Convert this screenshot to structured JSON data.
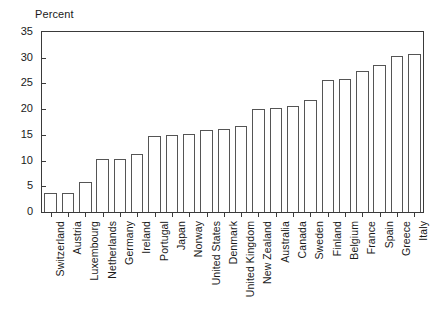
{
  "chart_data": {
    "type": "bar",
    "title": "",
    "ylabel": "Percent",
    "xlabel": "",
    "ylim": [
      0,
      35
    ],
    "yticks": [
      0,
      5,
      10,
      15,
      20,
      25,
      30,
      35
    ],
    "grid": false,
    "legend": null,
    "categories": [
      "Switzerland",
      "Austria",
      "Luxembourg",
      "Netherlands",
      "Germany",
      "Ireland",
      "Portugal",
      "Japan",
      "Norway",
      "United States",
      "Denmark",
      "United Kingdom",
      "New Zealand",
      "Australia",
      "Canada",
      "Sweden",
      "Finland",
      "Belgium",
      "France",
      "Spain",
      "Greece",
      "Italy"
    ],
    "values": [
      3.7,
      3.7,
      5.9,
      10.4,
      10.4,
      11.3,
      14.8,
      14.9,
      15.1,
      15.9,
      16.1,
      16.7,
      20.1,
      20.2,
      20.6,
      21.8,
      25.6,
      25.9,
      27.5,
      28.5,
      30.4,
      30.8
    ],
    "bar_fill": "#ffffff",
    "bar_stroke": "#555555",
    "axis_color": "#3a3a3a",
    "background": "#ffffff"
  }
}
